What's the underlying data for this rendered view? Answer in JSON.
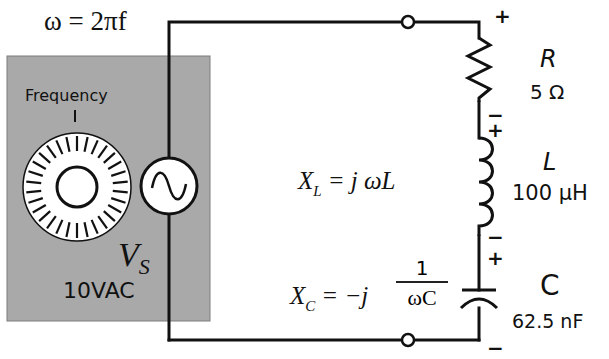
{
  "diagram": {
    "type": "series RLC circuit with variable-frequency AC source",
    "omega_formula": "ω = 2πf",
    "source": {
      "panel_color": "#a9a9a9",
      "knob_label": "Frequency",
      "symbol_name": "V",
      "symbol_subscript": "S",
      "value": "10VAC"
    },
    "components": {
      "resistor": {
        "name": "R",
        "value": "5 Ω",
        "plus": "+",
        "minus": "−"
      },
      "inductor": {
        "name": "L",
        "value": "100 μH",
        "plus": "+",
        "minus": "−"
      },
      "capacitor": {
        "name": "C",
        "value": "62.5 nF",
        "plus": "+",
        "minus": "−"
      }
    },
    "equations": {
      "xl": {
        "lhs": "X",
        "sub": "L",
        "rhs": "= j ωL"
      },
      "xc": {
        "lhs": "X",
        "sub": "C",
        "rhs": "= −j",
        "numerator": "1",
        "denominator": "ωC"
      }
    },
    "colors": {
      "wire": "#111111",
      "panel": "#a9a9a9",
      "dial_fill": "#ffffff"
    }
  }
}
